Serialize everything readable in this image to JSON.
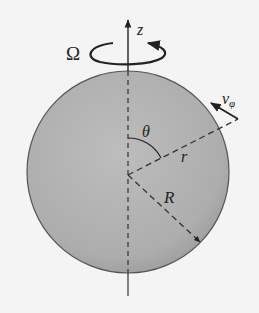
{
  "diagram": {
    "colors": {
      "background": "#f4f4f4",
      "sphere_fill": "#b4b4b4",
      "sphere_edge": "#555555",
      "ink": "#222222"
    },
    "sphere": {
      "cx": 128,
      "cy": 172,
      "r": 101
    },
    "labels": {
      "omega": "Ω",
      "z_axis": "z",
      "theta": "θ",
      "r": "r",
      "R": "R",
      "v": "v",
      "v_sub": "φ"
    }
  }
}
